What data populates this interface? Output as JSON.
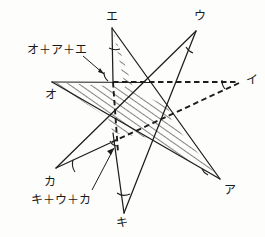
{
  "figure": {
    "stroke_color": "#1d1d1b",
    "hatch_color": "#1d1d1b",
    "background_color": "#fdfdfb",
    "vertices": [
      {
        "id": "e",
        "label": "エ",
        "x": 112,
        "y": 28,
        "label_x": 106,
        "label_y": 11
      },
      {
        "id": "u",
        "label": "ウ",
        "x": 196,
        "y": 31,
        "label_x": 194,
        "label_y": 10
      },
      {
        "id": "i",
        "label": "イ",
        "x": 241,
        "y": 82,
        "label_x": 246,
        "label_y": 76
      },
      {
        "id": "a",
        "label": "ア",
        "x": 220,
        "y": 179,
        "label_x": 224,
        "label_y": 185
      },
      {
        "id": "ki",
        "label": "キ",
        "x": 124,
        "y": 213,
        "label_x": 118,
        "label_y": 218
      },
      {
        "id": "ka",
        "label": "カ",
        "x": 56,
        "y": 168,
        "label_x": 45,
        "label_y": 177
      },
      {
        "id": "o",
        "label": "オ",
        "x": 52,
        "y": 82,
        "label_x": 46,
        "label_y": 90
      }
    ],
    "annotations": [
      {
        "id": "sum-top",
        "label": "オ＋ア＋エ",
        "x": 28,
        "y": 48
      },
      {
        "id": "sum-bottom",
        "label": "キ＋ウ＋カ",
        "x": 32,
        "y": 196
      }
    ],
    "lines": {
      "solid": "star chords drawn as thin black strokes",
      "dashed": "horizontal chord to イ, chord イ to lower-left, vertical chord"
    },
    "angle_arcs": [
      {
        "at": "e",
        "note": "arc at エ apex"
      },
      {
        "at": "u",
        "note": "arc at ウ apex"
      },
      {
        "at": "i",
        "note": "arc at イ apex"
      },
      {
        "at": "ki",
        "note": "arc at キ apex"
      },
      {
        "at": "ka",
        "note": "arc at カ apex"
      },
      {
        "at": "center",
        "note": "small right-angle style arc inside"
      }
    ]
  }
}
